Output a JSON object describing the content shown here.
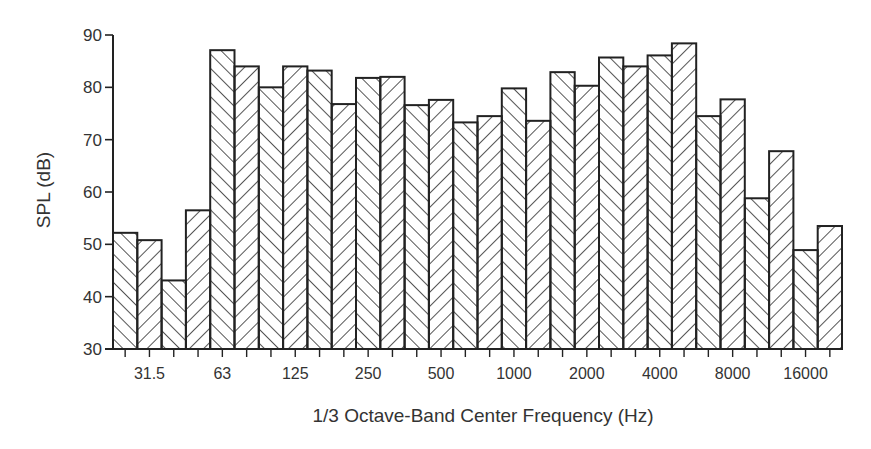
{
  "chart_data": {
    "type": "bar",
    "title": "",
    "xlabel": "1/3 Octave-Band Center Frequency (Hz)",
    "ylabel": "SPL (dB)",
    "ylim": [
      30,
      90
    ],
    "yticks": [
      30,
      40,
      50,
      60,
      70,
      80,
      90
    ],
    "grid": false,
    "legend": null,
    "categories": [
      "25",
      "31.5",
      "40",
      "50",
      "63",
      "80",
      "100",
      "125",
      "160",
      "200",
      "250",
      "315",
      "400",
      "500",
      "630",
      "800",
      "1000",
      "1250",
      "1600",
      "2000",
      "2500",
      "3150",
      "4000",
      "5000",
      "6300",
      "8000",
      "10000",
      "12500",
      "16000",
      "20000"
    ],
    "xtick_labels": [
      {
        "index": 1,
        "label": "31.5"
      },
      {
        "index": 4,
        "label": "63"
      },
      {
        "index": 7,
        "label": "125"
      },
      {
        "index": 10,
        "label": "250"
      },
      {
        "index": 13,
        "label": "500"
      },
      {
        "index": 16,
        "label": "1000"
      },
      {
        "index": 19,
        "label": "2000"
      },
      {
        "index": 22,
        "label": "4000"
      },
      {
        "index": 25,
        "label": "8000"
      },
      {
        "index": 28,
        "label": "16000"
      }
    ],
    "values": [
      52.2,
      50.8,
      43.1,
      56.5,
      87.1,
      84.0,
      80.0,
      84.0,
      83.2,
      76.8,
      81.8,
      82.0,
      76.6,
      77.6,
      73.3,
      74.5,
      79.8,
      73.6,
      82.9,
      80.3,
      85.7,
      84.0,
      86.1,
      88.4,
      74.5,
      77.7,
      58.8,
      67.8,
      48.9,
      53.5
    ],
    "style": {
      "fill": "hatched",
      "hatch_alternates": [
        "/",
        "\\"
      ],
      "bar_edge_color": "#222222",
      "background": "#ffffff"
    }
  }
}
